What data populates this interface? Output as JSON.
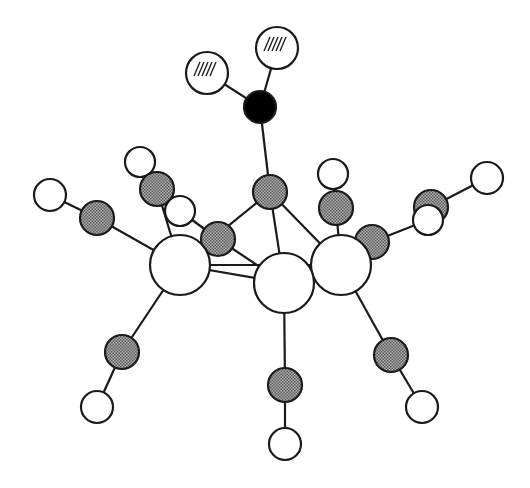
{
  "diagram": {
    "type": "ball-and-stick molecular structure",
    "colors": {
      "background": "#ffffff",
      "stroke": "#1a1a1a",
      "metal_fill": "#ffffff",
      "carbon_fill": "#8c8c8c",
      "oxygen_fill": "#ffffff",
      "central_atom_fill": "#000000",
      "hashed_fill": "#ffffff"
    },
    "atoms": [
      {
        "id": "h1",
        "kind": "hashed",
        "x": 207,
        "y": 73,
        "r": 21
      },
      {
        "id": "h2",
        "kind": "hashed",
        "x": 277,
        "y": 48,
        "r": 21
      },
      {
        "id": "n1",
        "kind": "black",
        "x": 260,
        "y": 107,
        "r": 16
      },
      {
        "id": "c_top",
        "kind": "gray",
        "x": 270,
        "y": 192,
        "r": 17
      },
      {
        "id": "o_l1",
        "kind": "white",
        "x": 140,
        "y": 162,
        "r": 15
      },
      {
        "id": "c_l1",
        "kind": "gray",
        "x": 157,
        "y": 189,
        "r": 17
      },
      {
        "id": "o_l2",
        "kind": "white",
        "x": 50,
        "y": 195,
        "r": 16
      },
      {
        "id": "c_l2",
        "kind": "gray",
        "x": 97,
        "y": 218,
        "r": 17
      },
      {
        "id": "o_l3",
        "kind": "white",
        "x": 180,
        "y": 211,
        "r": 15
      },
      {
        "id": "c_l3",
        "kind": "gray",
        "x": 218,
        "y": 239,
        "r": 17
      },
      {
        "id": "o_r1",
        "kind": "white",
        "x": 333,
        "y": 174,
        "r": 15
      },
      {
        "id": "c_r1",
        "kind": "gray",
        "x": 336,
        "y": 208,
        "r": 17
      },
      {
        "id": "c_r3",
        "kind": "gray",
        "x": 431,
        "y": 207,
        "r": 17
      },
      {
        "id": "o_r3b",
        "kind": "white",
        "x": 487,
        "y": 178,
        "r": 16
      },
      {
        "id": "o_r3",
        "kind": "white",
        "x": 428,
        "y": 220,
        "r": 15
      },
      {
        "id": "c_r2",
        "kind": "gray",
        "x": 372,
        "y": 242,
        "r": 17
      },
      {
        "id": "m1",
        "kind": "metal",
        "x": 180,
        "y": 265,
        "r": 30
      },
      {
        "id": "m3",
        "kind": "metal",
        "x": 341,
        "y": 265,
        "r": 30
      },
      {
        "id": "m2",
        "kind": "metal",
        "x": 284,
        "y": 283,
        "r": 30
      },
      {
        "id": "c_b1",
        "kind": "gray",
        "x": 122,
        "y": 352,
        "r": 17
      },
      {
        "id": "o_b1",
        "kind": "white",
        "x": 97,
        "y": 407,
        "r": 16
      },
      {
        "id": "c_b2",
        "kind": "gray",
        "x": 285,
        "y": 385,
        "r": 17
      },
      {
        "id": "o_b2",
        "kind": "white",
        "x": 285,
        "y": 444,
        "r": 16
      },
      {
        "id": "c_b3",
        "kind": "gray",
        "x": 391,
        "y": 355,
        "r": 17
      },
      {
        "id": "o_b3",
        "kind": "white",
        "x": 422,
        "y": 407,
        "r": 16
      }
    ],
    "bonds": [
      [
        "h1",
        "n1"
      ],
      [
        "h2",
        "n1"
      ],
      [
        "n1",
        "c_top"
      ],
      [
        "c_top",
        "m1"
      ],
      [
        "c_top",
        "m2"
      ],
      [
        "c_top",
        "m3"
      ],
      [
        "o_l1",
        "c_l1"
      ],
      [
        "c_l1",
        "m1"
      ],
      [
        "o_l2",
        "c_l2"
      ],
      [
        "c_l2",
        "m1"
      ],
      [
        "o_l3",
        "c_l3"
      ],
      [
        "c_l3",
        "m1"
      ],
      [
        "c_l3",
        "m2"
      ],
      [
        "m1",
        "m2"
      ],
      [
        "m1",
        "m3"
      ],
      [
        "m2",
        "m3"
      ],
      [
        "o_r1",
        "c_r1"
      ],
      [
        "c_r1",
        "m3"
      ],
      [
        "c_r2",
        "m3"
      ],
      [
        "c_r2",
        "m2"
      ],
      [
        "c_r2",
        "o_r3"
      ],
      [
        "o_r3b",
        "c_r3"
      ],
      [
        "m1",
        "c_b1"
      ],
      [
        "c_b1",
        "o_b1"
      ],
      [
        "m2",
        "c_b2"
      ],
      [
        "c_b2",
        "o_b2"
      ],
      [
        "m3",
        "c_b3"
      ],
      [
        "c_b3",
        "o_b3"
      ]
    ]
  }
}
